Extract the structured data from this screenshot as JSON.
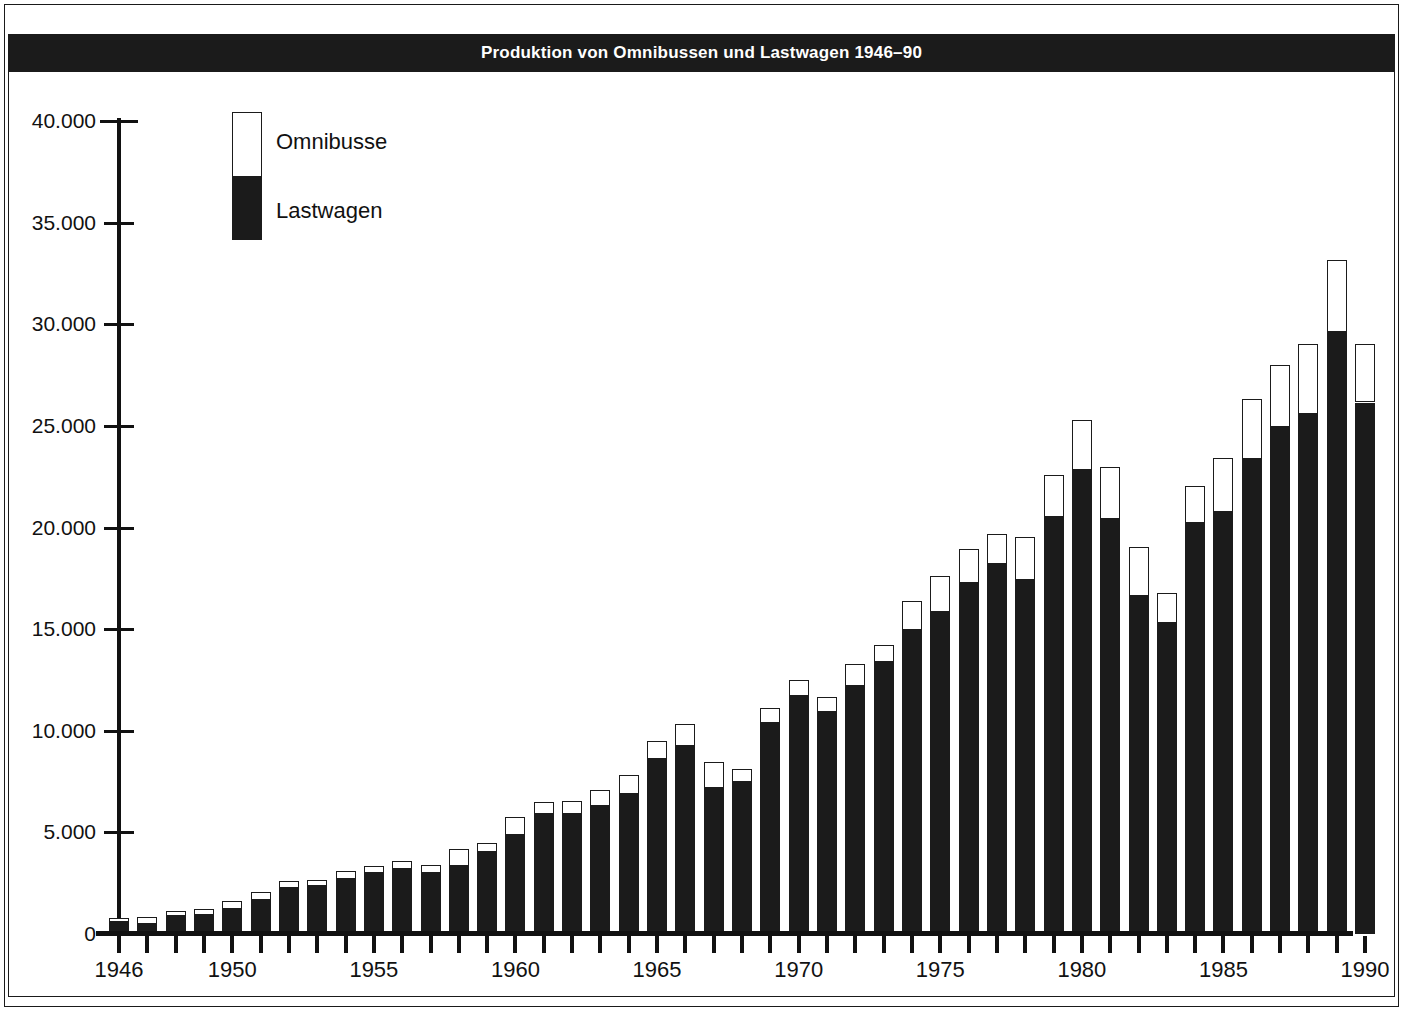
{
  "title": "Produktion von Omnibussen und Lastwagen 1946–90",
  "legend": {
    "items": [
      {
        "label": "Omnibusse",
        "color": "#ffffff"
      },
      {
        "label": "Lastwagen",
        "color": "#1b1b1b"
      }
    ]
  },
  "axes": {
    "y_tick_labels": [
      "40.000",
      "35.000",
      "30.000",
      "25.000",
      "20.000",
      "15.000",
      "10.000",
      "5.000",
      "0"
    ],
    "y_tick_values": [
      40000,
      35000,
      30000,
      25000,
      20000,
      15000,
      10000,
      5000,
      0
    ],
    "x_tick_labels": [
      "1946",
      "1950",
      "1955",
      "1960",
      "1965",
      "1970",
      "1975",
      "1980",
      "1985",
      "1990"
    ],
    "x_tick_years": [
      1946,
      1950,
      1955,
      1960,
      1965,
      1970,
      1975,
      1980,
      1985,
      1990
    ]
  },
  "chart_data": {
    "type": "bar",
    "stacked": true,
    "title": "Produktion von Omnibussen und Lastwagen 1946–90",
    "xlabel": "",
    "ylabel": "",
    "ylim": [
      0,
      40000
    ],
    "grid": false,
    "legend_position": "top-left-inside",
    "categories": [
      1946,
      1947,
      1948,
      1949,
      1950,
      1951,
      1952,
      1953,
      1954,
      1955,
      1956,
      1957,
      1958,
      1959,
      1960,
      1961,
      1962,
      1963,
      1964,
      1965,
      1966,
      1967,
      1968,
      1969,
      1970,
      1971,
      1972,
      1973,
      1974,
      1975,
      1976,
      1977,
      1978,
      1979,
      1980,
      1981,
      1982,
      1983,
      1984,
      1985,
      1986,
      1987,
      1988,
      1989,
      1990
    ],
    "series": [
      {
        "name": "Lastwagen",
        "color": "#1b1b1b",
        "values": [
          600,
          500,
          900,
          950,
          1250,
          1650,
          2250,
          2350,
          2700,
          3000,
          3200,
          3000,
          3350,
          4050,
          4850,
          5900,
          5900,
          6300,
          6900,
          8600,
          9250,
          7200,
          7500,
          10400,
          11700,
          10900,
          12200,
          13400,
          14950,
          15850,
          17250,
          18200,
          17400,
          20500,
          22850,
          20400,
          16650,
          15300,
          20200,
          20750,
          23350,
          24950,
          25600,
          29600,
          26150
        ]
      },
      {
        "name": "Omnibusse",
        "color": "#ffffff",
        "values": [
          200,
          350,
          250,
          300,
          350,
          400,
          350,
          300,
          400,
          350,
          400,
          400,
          850,
          450,
          900,
          600,
          650,
          800,
          900,
          900,
          1100,
          1250,
          600,
          700,
          800,
          750,
          1100,
          800,
          1450,
          1750,
          1700,
          1500,
          2150,
          2100,
          2450,
          2600,
          2400,
          1500,
          1850,
          2650,
          2950,
          3050,
          3450,
          3550,
          2900
        ]
      }
    ]
  }
}
